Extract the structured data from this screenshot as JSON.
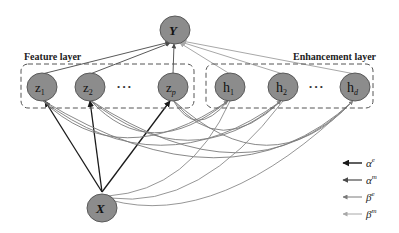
{
  "diagram": {
    "output_node": {
      "label": "Y"
    },
    "input_node": {
      "label": "X"
    },
    "feature_layer": {
      "title": "Feature layer",
      "nodes": [
        {
          "base": "z",
          "sub": "1"
        },
        {
          "base": "z",
          "sub": "2"
        },
        {
          "base": "z",
          "sub": "p"
        }
      ],
      "ellipsis": "• • •"
    },
    "enhancement_layer": {
      "title": "Enhancement layer",
      "nodes": [
        {
          "base": "h",
          "sub": "1"
        },
        {
          "base": "h",
          "sub": "2"
        },
        {
          "base": "h",
          "sub": "d"
        }
      ],
      "ellipsis": "• • •"
    },
    "legend": [
      {
        "symbol": "α",
        "sup": "e",
        "color": "#1a1a1a"
      },
      {
        "symbol": "α",
        "sup": "m",
        "color": "#4a4a4a"
      },
      {
        "symbol": "β",
        "sup": "e",
        "color": "#7a7a7a"
      },
      {
        "symbol": "β",
        "sup": "m",
        "color": "#a8a8a8"
      }
    ],
    "colors": {
      "node_fill": "#8c8c8c",
      "node_stroke": "#5a5a5a",
      "box_stroke": "#555555"
    }
  }
}
